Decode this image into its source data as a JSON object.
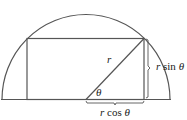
{
  "diagram": {
    "type": "geometry",
    "labels": {
      "radius": "r",
      "angle": "θ",
      "height": "r sin θ",
      "height_r": "r",
      "height_fn": " sin ",
      "height_theta": "θ",
      "width": "r cos θ",
      "width_r": "r",
      "width_fn": " cos ",
      "width_theta": "θ"
    },
    "colors": {
      "stroke": "#555555",
      "text": "#1a1a1a",
      "background": "#ffffff"
    }
  }
}
